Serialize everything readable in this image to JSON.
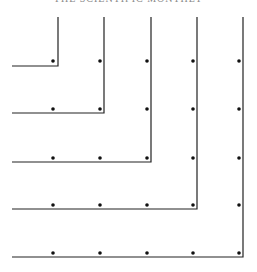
{
  "header": {
    "text": "THE SCIENTIFIC MONTHLY"
  },
  "diagram": {
    "line_color": "#222222",
    "dot_color": "#111111",
    "columns_x": [
      53,
      100,
      147,
      193,
      239
    ],
    "rows_y": [
      61,
      109,
      158,
      205,
      253
    ],
    "gnomons": [
      {
        "n": 1,
        "corner_x": 58,
        "corner_y": 66
      },
      {
        "n": 2,
        "corner_x": 104,
        "corner_y": 113
      },
      {
        "n": 3,
        "corner_x": 151,
        "corner_y": 162
      },
      {
        "n": 4,
        "corner_x": 197,
        "corner_y": 209
      },
      {
        "n": 5,
        "corner_x": 243,
        "corner_y": 257
      }
    ],
    "line_top_y": 17,
    "line_left_x": 12,
    "dot_counts": [
      1,
      4,
      9,
      16,
      25
    ]
  }
}
